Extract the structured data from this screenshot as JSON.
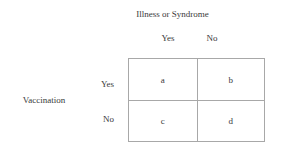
{
  "diagram": {
    "type": "2x2-contingency-table",
    "column_variable": {
      "title": "Illness or Syndrome",
      "levels": [
        "Yes",
        "No"
      ]
    },
    "row_variable": {
      "title": "Vaccination",
      "levels": [
        "Yes",
        "No"
      ]
    },
    "cells": [
      {
        "id": "a",
        "label": "a",
        "row": "Yes",
        "column": "Yes"
      },
      {
        "id": "b",
        "label": "b",
        "row": "Yes",
        "column": "No"
      },
      {
        "id": "c",
        "label": "c",
        "row": "No",
        "column": "Yes"
      },
      {
        "id": "d",
        "label": "d",
        "row": "No",
        "column": "No"
      }
    ],
    "colors": {
      "border": "#a8a8a8",
      "text": "#3a3a3a",
      "background": "#ffffff"
    }
  }
}
